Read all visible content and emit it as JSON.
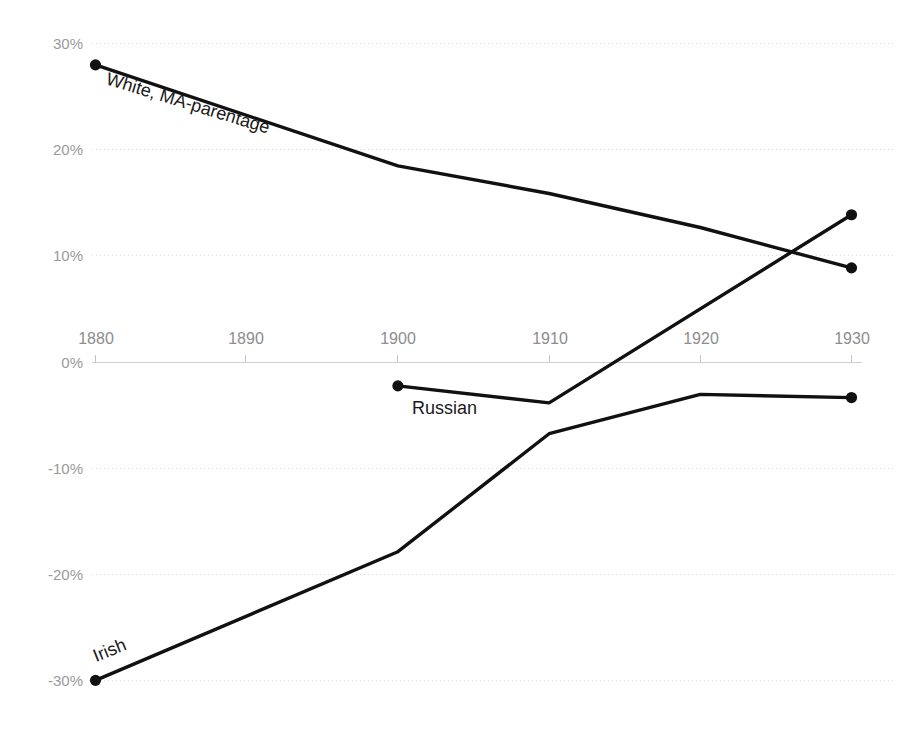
{
  "chart_data": {
    "type": "line",
    "title": "",
    "subtitle": "",
    "xlabel": "",
    "ylabel": "",
    "xlim": [
      1880,
      1930
    ],
    "ylim": [
      -30,
      30
    ],
    "grid": true,
    "legend_position": "inline-series-labels",
    "x_ticks": [
      1880,
      1890,
      1900,
      1910,
      1920,
      1930
    ],
    "x_tick_labels": [
      "1880",
      "1890",
      "1900",
      "1910",
      "1920",
      "1930"
    ],
    "y_ticks": [
      30,
      20,
      10,
      0,
      -10,
      -20,
      -30
    ],
    "y_tick_labels": [
      "30%",
      "20%",
      "10%",
      "0%",
      "-10%",
      "-20%",
      "-30%"
    ],
    "line_color": "#111111",
    "gridline_color": "#d9d9d9",
    "tick_label_color": "#8d8d8d",
    "series": [
      {
        "name": "White, MA-parentage",
        "label": "White, MA-parentage",
        "label_rotation": 17,
        "x": [
          1880,
          1900,
          1910,
          1920,
          1930
        ],
        "values": [
          28.0,
          18.5,
          15.9,
          12.7,
          8.9
        ],
        "marker_points": [
          1880,
          1930
        ]
      },
      {
        "name": "Russian",
        "label": "Russian",
        "label_rotation": 0,
        "x": [
          1900,
          1910,
          1930
        ],
        "values": [
          -2.2,
          -3.8,
          13.9
        ],
        "marker_points": [
          1900,
          1930
        ]
      },
      {
        "name": "Irish",
        "label": "Irish",
        "label_rotation": -22,
        "x": [
          1880,
          1900,
          1910,
          1920,
          1930
        ],
        "values": [
          -29.9,
          -17.8,
          -6.7,
          -3.0,
          -3.3
        ],
        "marker_points": [
          1880,
          1930
        ]
      }
    ]
  },
  "labels": {
    "white": "White, MA-parentage",
    "russian": "Russian",
    "irish": "Irish"
  },
  "y_axis": {
    "t30": "30%",
    "t20": "20%",
    "t10": "10%",
    "t0": "0%",
    "tm10": "-10%",
    "tm20": "-20%",
    "tm30": "-30%"
  },
  "x_axis": {
    "t1880": "1880",
    "t1890": "1890",
    "t1900": "1900",
    "t1910": "1910",
    "t1920": "1920",
    "t1930": "1930"
  }
}
